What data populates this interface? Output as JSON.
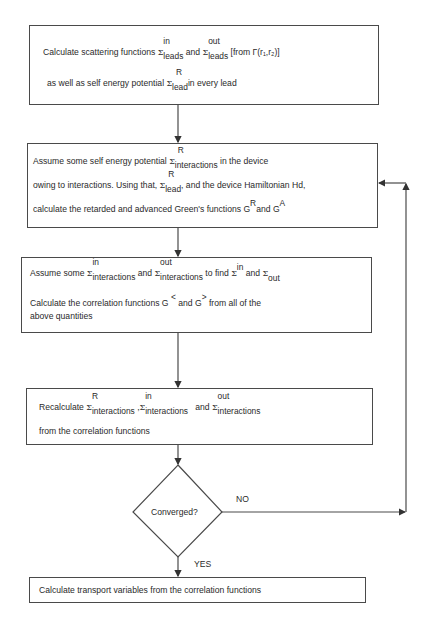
{
  "boxes": {
    "b1": {
      "l1_pre": "Calculate scattering functions",
      "sigma": "Σ",
      "in": "in",
      "leads": "leads",
      "and": "and",
      "out": "out",
      "leads2": "leads",
      "from": "[from  Γ(r₁,r₂)]",
      "l2_pre": "as well as self energy potential",
      "R": "R",
      "lead": "lead",
      "l2_post": "in every lead"
    },
    "b2": {
      "l1_pre": "Assume some self energy potential",
      "sigma": "Σ",
      "R": "R",
      "interactions": "interactions",
      "l1_post": "in the device",
      "l2_pre": "owing to interactions. Using that,",
      "R2": "R",
      "lead": "lead",
      "l2_post": ", and the device Hamiltonian Hd,",
      "l3_pre": "calculate the retarded and advanced Green's functions G",
      "GR": "R",
      "and": "and G",
      "GA": "A"
    },
    "b3": {
      "l1_pre": "Assume some",
      "sigma": "Σ",
      "in": "in",
      "interactions": "interactions",
      "and": "and",
      "out": "out",
      "interactions2": "interactions",
      "tofind": "to find",
      "in2": "in",
      "and2": "and",
      "out2": "out",
      "l2": "Calculate the correlation functions G",
      "lt": "<",
      "and3": "and G",
      "gt": ">",
      "l2_post": "from all of the",
      "l3": "above quantities"
    },
    "b4": {
      "l1_pre": "Recalculate",
      "sigma": "Σ",
      "R": "R",
      "interactions": "interactions",
      "comma": ",",
      "in": "in",
      "interactions2": "interactions",
      "and": "and",
      "out": "out",
      "interactions3": "interactions",
      "l2": "from the correlation functions"
    },
    "decision": {
      "label": "Converged?",
      "no": "NO",
      "yes": "YES"
    },
    "b5": {
      "text": "Calculate transport variables from the correlation functions"
    }
  },
  "colors": {
    "stroke": "#4a4a4a",
    "text": "#2a2a2a",
    "background": "#ffffff"
  }
}
